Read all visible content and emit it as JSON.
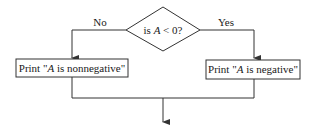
{
  "diagram": {
    "type": "flowchart",
    "decision": {
      "prefix": "is ",
      "var": "A",
      "suffix": " < 0?"
    },
    "branches": {
      "no": {
        "label": "No",
        "action_prefix": "Print \"",
        "action_var": "A",
        "action_suffix": " is nonnegative\""
      },
      "yes": {
        "label": "Yes",
        "action_prefix": "Print \"",
        "action_var": "A",
        "action_suffix": " is negative\""
      }
    },
    "colors": {
      "stroke": "#333333",
      "text": "#1a1a1a",
      "background": "#ffffff"
    }
  }
}
